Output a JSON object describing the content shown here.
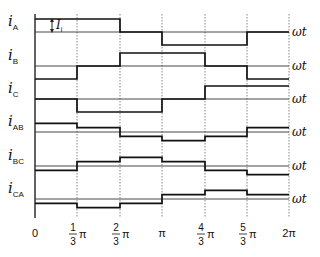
{
  "diagram": {
    "type": "step-waveforms",
    "x_axis": {
      "label": "ωt",
      "ticks": [
        {
          "value": "0",
          "num": "",
          "den": "",
          "suffix": ""
        },
        {
          "value": "1/3 π",
          "num": "1",
          "den": "3",
          "suffix": "π"
        },
        {
          "value": "2/3 π",
          "num": "2",
          "den": "3",
          "suffix": "π"
        },
        {
          "value": "π",
          "num": "",
          "den": "",
          "suffix": "π"
        },
        {
          "value": "4/3 π",
          "num": "4",
          "den": "3",
          "suffix": "π"
        },
        {
          "value": "5/3 π",
          "num": "5",
          "den": "3",
          "suffix": "π"
        },
        {
          "value": "2π",
          "num": "",
          "den": "",
          "suffix": "2π"
        }
      ]
    },
    "annotation": {
      "symbol": "I",
      "subscript": "i"
    },
    "waveforms": [
      {
        "name": "i",
        "sub": "A",
        "axis_label": "ωt",
        "levels": [
          1,
          1,
          0,
          -1,
          -1,
          0
        ]
      },
      {
        "name": "i",
        "sub": "B",
        "axis_label": "ωt",
        "levels": [
          -1,
          0,
          1,
          1,
          0,
          -1
        ]
      },
      {
        "name": "i",
        "sub": "C",
        "axis_label": "ωt",
        "levels": [
          0,
          -1,
          -1,
          0,
          1,
          1
        ]
      },
      {
        "name": "i",
        "sub": "AB",
        "axis_label": "ωt",
        "levels": [
          0.67,
          0.33,
          -0.33,
          -0.67,
          -0.33,
          0.33
        ]
      },
      {
        "name": "i",
        "sub": "BC",
        "axis_label": "ωt",
        "levels": [
          -0.33,
          0.33,
          0.67,
          0.33,
          -0.33,
          -0.67
        ]
      },
      {
        "name": "i",
        "sub": "CA",
        "axis_label": "ωt",
        "levels": [
          -0.33,
          -0.67,
          -0.33,
          0.33,
          0.67,
          0.33
        ]
      }
    ]
  }
}
